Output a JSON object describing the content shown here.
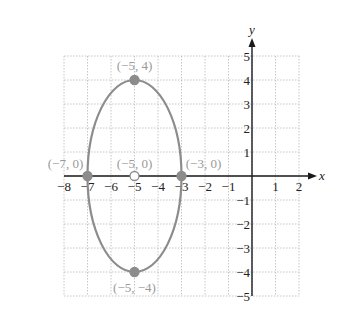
{
  "chart_data": {
    "type": "scatter",
    "title": "",
    "xlabel": "x",
    "ylabel": "y",
    "xlim": [
      -8,
      2
    ],
    "ylim": [
      -5,
      5
    ],
    "grid": true,
    "x_ticks": [
      "−8",
      "−7",
      "−6",
      "−5",
      "−4",
      "−3",
      "−2",
      "−1",
      "1",
      "2"
    ],
    "y_ticks": [
      "5",
      "4",
      "3",
      "2",
      "1",
      "−1",
      "−2",
      "−3",
      "−4",
      "−5"
    ],
    "curve": {
      "kind": "ellipse",
      "center": [
        -5,
        0
      ],
      "semi_axis_x": 2,
      "semi_axis_y": 4,
      "color": "#8c8c8c"
    },
    "points": [
      {
        "x": -5,
        "y": 4,
        "label": "(−5, 4)",
        "filled": true
      },
      {
        "x": -7,
        "y": 0,
        "label": "(−7, 0)",
        "filled": true
      },
      {
        "x": -3,
        "y": 0,
        "label": "(−3, 0)",
        "filled": true
      },
      {
        "x": -5,
        "y": -4,
        "label": "(−5, −4)",
        "filled": true
      },
      {
        "x": -5,
        "y": 0,
        "label": "(−5, 0)",
        "filled": false
      }
    ],
    "colors": {
      "grid": "#b8b8b8",
      "axis": "#1a1a1a",
      "curve": "#8c8c8c",
      "point": "#8c8c8c",
      "label": "#9a9a9a"
    }
  }
}
